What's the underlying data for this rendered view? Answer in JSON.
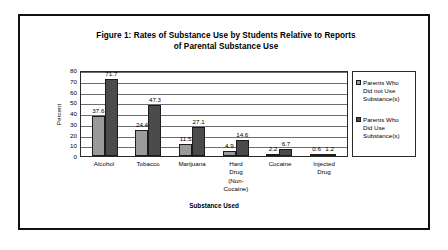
{
  "chart_data": {
    "type": "bar",
    "title": "Figure 1:  Rates of Substance Use by Students Relative to Reports of Parental Substance Use",
    "title_line1": "Figure 1:  Rates of Substance Use by Students Relative to Reports",
    "title_line2": "of Parental Substance Use",
    "xlabel": "Substance Used",
    "ylabel": "Percent",
    "ylim": [
      0,
      80
    ],
    "yticks": [
      80,
      70,
      60,
      50,
      40,
      30,
      20,
      10,
      0
    ],
    "grid": true,
    "legend_position": "right",
    "categories": [
      "Alcohol",
      "Tobacco",
      "Marijuana",
      "Hard Drug (Non-Cocaine)",
      "Cocaine",
      "Injected Drug"
    ],
    "category_lines": [
      [
        "Alcohol"
      ],
      [
        "Tobacco"
      ],
      [
        "Marijuana"
      ],
      [
        "Hard",
        "Drug",
        "(Non-",
        "Cocaine)"
      ],
      [
        "Cocaine"
      ],
      [
        "Injected",
        "Drug"
      ]
    ],
    "series": [
      {
        "name": "Parents Who Did not Use Substance(s)",
        "name_lines": [
          "Parents Who",
          "Did not Use",
          "Substance(s)"
        ],
        "color": "#9a9a9a",
        "values": [
          37.6,
          24.4,
          11.5,
          4.9,
          2.2,
          0.6
        ]
      },
      {
        "name": "Parents Who Did Use Substance(s)",
        "name_lines": [
          "Parents Who",
          "Did Use",
          "Substance(s)"
        ],
        "color": "#4b4b4b",
        "values": [
          71.7,
          47.3,
          27.1,
          14.6,
          6.7,
          1.2
        ]
      }
    ]
  }
}
